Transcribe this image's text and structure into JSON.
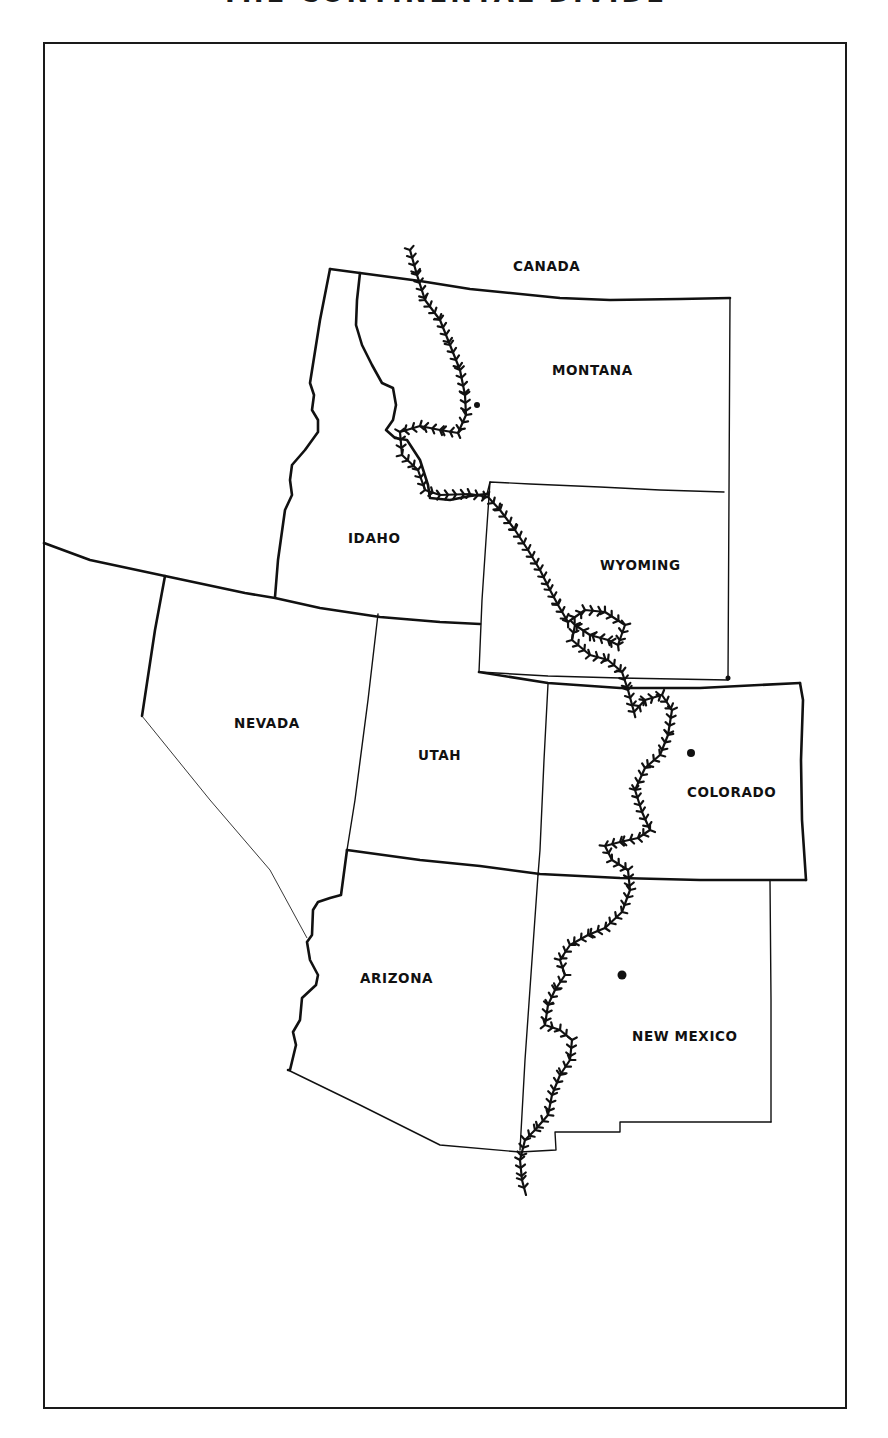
{
  "title": "THE CONTINENTAL DIVIDE",
  "labels": {
    "canada": "CANADA",
    "montana": "MONTANA",
    "idaho": "IDAHO",
    "wyoming": "WYOMING",
    "nevada": "NEVADA",
    "utah": "UTAH",
    "colorado": "COLORADO",
    "arizona": "ARIZONA",
    "new_mexico": "NEW MEXICO"
  },
  "cities": [
    {
      "state": "Montana",
      "x": 477,
      "y": 405,
      "r": 3
    },
    {
      "state": "Colorado",
      "x": 691,
      "y": 753,
      "r": 4
    },
    {
      "state": "New Mexico",
      "x": 622,
      "y": 975,
      "r": 4.5
    }
  ],
  "divide_path": [
    [
      410,
      250
    ],
    [
      417,
      275
    ],
    [
      425,
      300
    ],
    [
      440,
      320
    ],
    [
      450,
      345
    ],
    [
      460,
      370
    ],
    [
      465,
      395
    ],
    [
      466,
      415
    ],
    [
      458,
      433
    ],
    [
      440,
      430
    ],
    [
      420,
      426
    ],
    [
      400,
      432
    ],
    [
      402,
      455
    ],
    [
      418,
      470
    ],
    [
      425,
      490
    ],
    [
      440,
      495
    ],
    [
      470,
      494
    ],
    [
      488,
      497
    ],
    [
      500,
      510
    ],
    [
      515,
      530
    ],
    [
      528,
      550
    ],
    [
      540,
      570
    ],
    [
      550,
      590
    ],
    [
      558,
      605
    ],
    [
      568,
      622
    ],
    [
      585,
      610
    ],
    [
      605,
      612
    ],
    [
      625,
      625
    ],
    [
      618,
      645
    ],
    [
      608,
      640
    ],
    [
      590,
      635
    ],
    [
      575,
      625
    ],
    [
      572,
      640
    ],
    [
      590,
      655
    ],
    [
      608,
      660
    ],
    [
      622,
      672
    ],
    [
      628,
      690
    ],
    [
      634,
      712
    ],
    [
      645,
      700
    ],
    [
      662,
      695
    ],
    [
      672,
      710
    ],
    [
      668,
      735
    ],
    [
      660,
      755
    ],
    [
      645,
      768
    ],
    [
      635,
      790
    ],
    [
      642,
      812
    ],
    [
      650,
      830
    ],
    [
      638,
      838
    ],
    [
      620,
      842
    ],
    [
      605,
      846
    ],
    [
      612,
      860
    ],
    [
      628,
      870
    ],
    [
      630,
      890
    ],
    [
      622,
      912
    ],
    [
      605,
      928
    ],
    [
      588,
      935
    ],
    [
      570,
      945
    ],
    [
      560,
      960
    ],
    [
      565,
      975
    ],
    [
      555,
      990
    ],
    [
      548,
      1005
    ],
    [
      545,
      1025
    ],
    [
      560,
      1030
    ],
    [
      572,
      1040
    ],
    [
      570,
      1060
    ],
    [
      560,
      1075
    ],
    [
      552,
      1095
    ],
    [
      548,
      1115
    ],
    [
      535,
      1130
    ],
    [
      525,
      1140
    ],
    [
      520,
      1160
    ],
    [
      522,
      1180
    ],
    [
      526,
      1195
    ]
  ],
  "style": {
    "ink": "#111111",
    "paper": "#ffffff"
  }
}
